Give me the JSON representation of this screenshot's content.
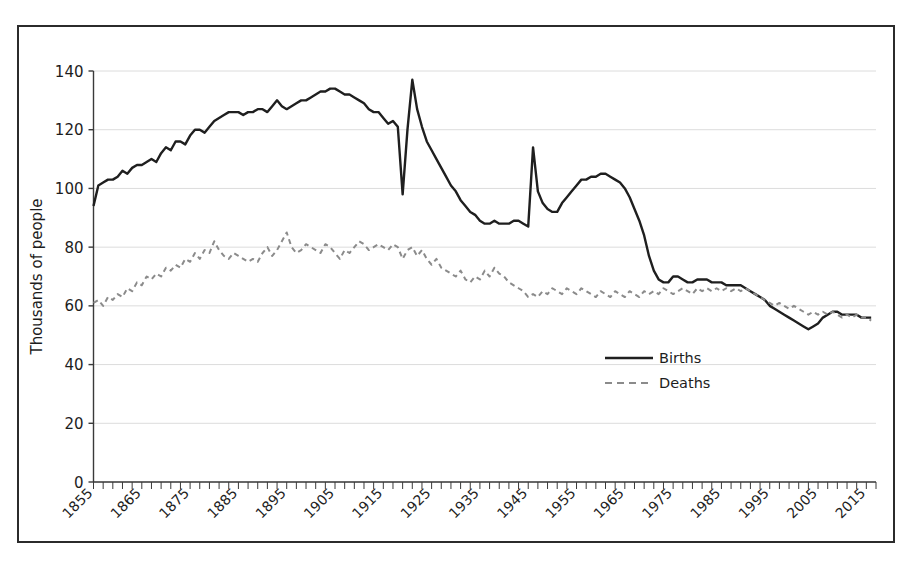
{
  "chart_data": {
    "type": "line",
    "title": "",
    "xlabel": "",
    "ylabel": "Thousands of people",
    "xlim": [
      1855,
      2017
    ],
    "ylim": [
      0,
      140
    ],
    "grid": "horizontal-only",
    "legend_position": "center",
    "yticks": [
      0,
      20,
      40,
      60,
      80,
      100,
      120,
      140
    ],
    "xticks": [
      1855,
      1865,
      1875,
      1885,
      1895,
      1905,
      1915,
      1925,
      1935,
      1945,
      1955,
      1965,
      1975,
      1985,
      1995,
      2005,
      2015
    ],
    "xtick_minor_step": 2,
    "colors": {
      "births": "#1f1f1f",
      "deaths": "#8b8b8b",
      "grid": "#dcdcdc",
      "axis": "#3a3a3a",
      "frame": "#2b2b2b"
    },
    "series": [
      {
        "name": "Births",
        "style": "solid",
        "color": "#1f1f1f",
        "x": [
          1855,
          1856,
          1857,
          1858,
          1859,
          1860,
          1861,
          1862,
          1863,
          1864,
          1865,
          1866,
          1867,
          1868,
          1869,
          1870,
          1871,
          1872,
          1873,
          1874,
          1875,
          1876,
          1877,
          1878,
          1879,
          1880,
          1881,
          1882,
          1883,
          1884,
          1885,
          1886,
          1887,
          1888,
          1889,
          1890,
          1891,
          1892,
          1893,
          1894,
          1895,
          1896,
          1897,
          1898,
          1899,
          1900,
          1901,
          1902,
          1903,
          1904,
          1905,
          1906,
          1907,
          1908,
          1909,
          1910,
          1911,
          1912,
          1913,
          1914,
          1915,
          1916,
          1917,
          1918,
          1919,
          1920,
          1921,
          1922,
          1923,
          1924,
          1925,
          1926,
          1927,
          1928,
          1929,
          1930,
          1931,
          1932,
          1933,
          1934,
          1935,
          1936,
          1937,
          1938,
          1939,
          1940,
          1941,
          1942,
          1943,
          1944,
          1945,
          1946,
          1947,
          1948,
          1949,
          1950,
          1951,
          1952,
          1953,
          1954,
          1955,
          1956,
          1957,
          1958,
          1959,
          1960,
          1961,
          1962,
          1963,
          1964,
          1965,
          1966,
          1967,
          1968,
          1969,
          1970,
          1971,
          1972,
          1973,
          1974,
          1975,
          1976,
          1977,
          1978,
          1979,
          1980,
          1981,
          1982,
          1983,
          1984,
          1985,
          1986,
          1987,
          1988,
          1989,
          1990,
          1991,
          1992,
          1993,
          1994,
          1995,
          1996,
          1997,
          1998,
          1999,
          2000,
          2001,
          2002,
          2003,
          2004,
          2005,
          2006,
          2007,
          2008,
          2009,
          2010,
          2011,
          2012,
          2013,
          2014,
          2015,
          2016
        ],
        "values": [
          94,
          101,
          102,
          103,
          103,
          104,
          106,
          105,
          107,
          108,
          108,
          109,
          110,
          109,
          112,
          114,
          113,
          116,
          116,
          115,
          118,
          120,
          120,
          119,
          121,
          123,
          124,
          125,
          126,
          126,
          126,
          125,
          126,
          126,
          127,
          127,
          126,
          128,
          130,
          128,
          127,
          128,
          129,
          130,
          130,
          131,
          132,
          133,
          133,
          134,
          134,
          133,
          132,
          132,
          131,
          130,
          129,
          127,
          126,
          126,
          124,
          122,
          123,
          121,
          98,
          120,
          137,
          127,
          121,
          116,
          113,
          110,
          107,
          104,
          101,
          99,
          96,
          94,
          92,
          91,
          89,
          88,
          88,
          89,
          88,
          88,
          88,
          89,
          89,
          88,
          87,
          114,
          99,
          95,
          93,
          92,
          92,
          95,
          97,
          99,
          101,
          103,
          103,
          104,
          104,
          105,
          105,
          104,
          103,
          102,
          100,
          97,
          93,
          89,
          84,
          77,
          72,
          69,
          68,
          68,
          70,
          70,
          69,
          68,
          68,
          69,
          69,
          69,
          68,
          68,
          68,
          67,
          67,
          67,
          67,
          66,
          65,
          64,
          63,
          62,
          60,
          59,
          58,
          57,
          56,
          55,
          54,
          53,
          52,
          53,
          54,
          56,
          57,
          58,
          58,
          57,
          57,
          57,
          57,
          56,
          56,
          56
        ]
      },
      {
        "name": "Deaths",
        "style": "dashed",
        "color": "#8b8b8b",
        "x": [
          1855,
          1856,
          1857,
          1858,
          1859,
          1860,
          1861,
          1862,
          1863,
          1864,
          1865,
          1866,
          1867,
          1868,
          1869,
          1870,
          1871,
          1872,
          1873,
          1874,
          1875,
          1876,
          1877,
          1878,
          1879,
          1880,
          1881,
          1882,
          1883,
          1884,
          1885,
          1886,
          1887,
          1888,
          1889,
          1890,
          1891,
          1892,
          1893,
          1894,
          1895,
          1896,
          1897,
          1898,
          1899,
          1900,
          1901,
          1902,
          1903,
          1904,
          1905,
          1906,
          1907,
          1908,
          1909,
          1910,
          1911,
          1912,
          1913,
          1914,
          1915,
          1916,
          1917,
          1918,
          1919,
          1920,
          1921,
          1922,
          1923,
          1924,
          1925,
          1926,
          1927,
          1928,
          1929,
          1930,
          1931,
          1932,
          1933,
          1934,
          1935,
          1936,
          1937,
          1938,
          1939,
          1940,
          1941,
          1942,
          1943,
          1944,
          1945,
          1946,
          1947,
          1948,
          1949,
          1950,
          1951,
          1952,
          1953,
          1954,
          1955,
          1956,
          1957,
          1958,
          1959,
          1960,
          1961,
          1962,
          1963,
          1964,
          1965,
          1966,
          1967,
          1968,
          1969,
          1970,
          1971,
          1972,
          1973,
          1974,
          1975,
          1976,
          1977,
          1978,
          1979,
          1980,
          1981,
          1982,
          1983,
          1984,
          1985,
          1986,
          1987,
          1988,
          1989,
          1990,
          1991,
          1992,
          1993,
          1994,
          1995,
          1996,
          1997,
          1998,
          1999,
          2000,
          2001,
          2002,
          2003,
          2004,
          2005,
          2006,
          2007,
          2008,
          2009,
          2010,
          2011,
          2012,
          2013,
          2014,
          2015,
          2016
        ],
        "values": [
          61,
          62,
          60,
          63,
          62,
          64,
          63,
          66,
          65,
          68,
          67,
          70,
          69,
          71,
          70,
          73,
          72,
          74,
          73,
          76,
          75,
          78,
          76,
          79,
          78,
          82,
          79,
          77,
          76,
          78,
          77,
          76,
          75,
          76,
          75,
          78,
          80,
          77,
          79,
          82,
          85,
          80,
          78,
          79,
          81,
          80,
          79,
          78,
          81,
          80,
          78,
          76,
          79,
          78,
          80,
          82,
          81,
          79,
          80,
          81,
          80,
          79,
          81,
          80,
          76,
          79,
          80,
          77,
          79,
          76,
          74,
          76,
          73,
          72,
          71,
          70,
          72,
          69,
          68,
          70,
          69,
          72,
          70,
          73,
          71,
          70,
          68,
          67,
          66,
          65,
          63,
          64,
          63,
          65,
          64,
          66,
          65,
          64,
          66,
          65,
          64,
          66,
          65,
          64,
          63,
          65,
          64,
          63,
          65,
          64,
          63,
          65,
          64,
          63,
          65,
          64,
          65,
          64,
          66,
          65,
          64,
          65,
          66,
          65,
          64,
          66,
          65,
          66,
          65,
          66,
          65,
          66,
          65,
          66,
          65,
          66,
          65,
          64,
          63,
          62,
          61,
          60,
          61,
          60,
          59,
          60,
          59,
          58,
          57,
          58,
          57,
          58,
          57,
          58,
          57,
          56,
          57,
          56,
          57,
          56,
          56,
          55
        ]
      }
    ]
  },
  "axis": {
    "ylabel": "Thousands of people",
    "ytick_labels": [
      "0",
      "20",
      "40",
      "60",
      "80",
      "100",
      "120",
      "140"
    ],
    "xtick_labels": [
      "1855",
      "1865",
      "1875",
      "1885",
      "1895",
      "1905",
      "1915",
      "1925",
      "1935",
      "1945",
      "1955",
      "1965",
      "1975",
      "1985",
      "1995",
      "2005",
      "2015"
    ]
  },
  "legend": {
    "items": [
      {
        "label": "Births",
        "style": "solid"
      },
      {
        "label": "Deaths",
        "style": "dashed"
      }
    ]
  }
}
